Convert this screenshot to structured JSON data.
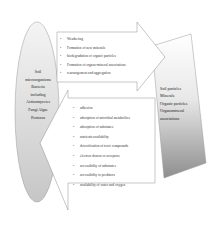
{
  "diagram": {
    "left_node": {
      "lines": [
        "Soil",
        "microorganisms",
        "Bacteria",
        "including",
        "Actinomycetes",
        "Fungi Algae",
        "Protozoa"
      ]
    },
    "right_node": {
      "lines": [
        "Soil particles",
        "Minerals",
        "Organic particles",
        "Organomineral",
        "associations"
      ]
    },
    "top_arrow": {
      "direction": "left-to-right",
      "items": [
        "Weathering",
        "Formation of new minerals",
        "biodegradation of organic particles",
        "Formation of organo-mineral associations",
        "rearrangement and aggregation"
      ]
    },
    "bottom_arrow": {
      "direction": "right-to-left",
      "items": [
        "adhesion",
        "adsorption of microbial metabolites",
        "adsorption of substrates",
        "nutrients availability",
        "detoxification of toxic compounds",
        "electron donors or acceptors",
        "accessibility of substrates",
        "accessibility to predators",
        "availability of water and oxygen"
      ]
    },
    "colors": {
      "ellipse_fill_top": "#f2f2f2",
      "ellipse_fill_bottom": "#c8c8c8",
      "right_fill_top": "#ffffff",
      "right_fill_bottom": "#9a9a9a",
      "arrow_fill": "#ffffff",
      "stroke": "#8c8c8c"
    }
  }
}
